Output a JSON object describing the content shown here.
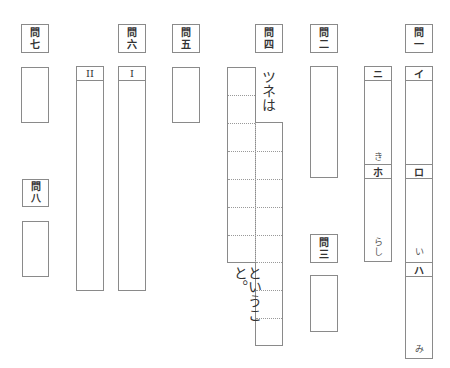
{
  "questions": {
    "q1": {
      "label_top": "問",
      "label_num": "一"
    },
    "q2": {
      "label_top": "問",
      "label_num": "二"
    },
    "q3": {
      "label_top": "問",
      "label_num": "三"
    },
    "q4": {
      "label_top": "問",
      "label_num": "四"
    },
    "q5": {
      "label_top": "問",
      "label_num": "五"
    },
    "q6": {
      "label_top": "問",
      "label_num": "六"
    },
    "q7": {
      "label_top": "問",
      "label_num": "七"
    },
    "q8": {
      "label_top": "問",
      "label_num": "八"
    }
  },
  "q1_parts": {
    "i": {
      "header": "イ"
    },
    "ro": {
      "header": "ロ",
      "suffix": "い"
    },
    "ha": {
      "header": "ハ",
      "suffix": "み"
    }
  },
  "col_ni_ho": {
    "ni": {
      "header": "ニ",
      "suffix": "き"
    },
    "ho": {
      "header": "ホ",
      "suffix_1": "ら",
      "suffix_2": "し"
    }
  },
  "q4_text": {
    "prefix": "ツネは",
    "suffix": "ということ。"
  },
  "q6_parts": {
    "roman1": {
      "header": "I"
    },
    "roman2": {
      "header": "II"
    }
  }
}
